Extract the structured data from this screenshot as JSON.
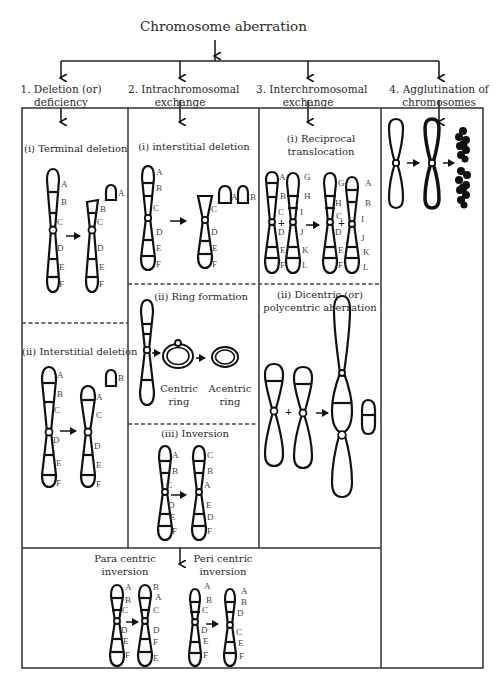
{
  "title": "Chromosome aberration",
  "categories": [
    {
      "id": 1,
      "label_line1": "1. Deletion (or)",
      "label_line2": "deficiency"
    },
    {
      "id": 2,
      "label_line1": "2. Intrachromosomal",
      "label_line2": "exchange"
    },
    {
      "id": 3,
      "label_line1": "3. Interchromosomal",
      "label_line2": "exchange"
    },
    {
      "id": 4,
      "label_line1": "4. Agglutination of",
      "label_line2": "chromosomes"
    }
  ],
  "deletion": {
    "terminal": {
      "title": "(i) Terminal deletion",
      "before_labels": [
        "A",
        "B",
        "C",
        "D",
        "E",
        "F"
      ],
      "after_labels": [
        "B",
        "C",
        "D",
        "E",
        "F"
      ],
      "fragment_label": "A"
    },
    "interstitial": {
      "title": "(ii) Interstitial deletion",
      "before_labels": [
        "A",
        "B",
        "C",
        "D",
        "E",
        "F"
      ],
      "after_labels": [
        "A",
        "C",
        "D",
        "E",
        "F"
      ],
      "fragment_label": "B"
    }
  },
  "intrachromosomal": {
    "interstitial": {
      "title": "(i)  interstitial deletion",
      "before_labels": [
        "A",
        "B",
        "C",
        "D",
        "E",
        "F"
      ],
      "after_labels": [
        "C",
        "D",
        "E",
        "F"
      ],
      "fragment_labels": [
        "A",
        "B"
      ]
    },
    "ring": {
      "title": "(ii) Ring formation",
      "centric_line1": "Centric",
      "centric_line2": "ring",
      "acentric_line1": "Acentric",
      "acentric_line2": "ring"
    },
    "inversion": {
      "title": "(iii) Inversion",
      "before_labels": [
        "A",
        "B",
        "C",
        "D",
        "E",
        "F"
      ],
      "after_labels": [
        "C",
        "B",
        "A",
        "E",
        "D",
        "F"
      ]
    }
  },
  "interchromosomal": {
    "reciprocal": {
      "title_line1": "(i) Reciprocal",
      "title_line2": "translocation",
      "before_left": [
        "A",
        "B",
        "C",
        "D",
        "E",
        "F"
      ],
      "before_right": [
        "G",
        "H",
        "I",
        "J",
        "K",
        "L"
      ],
      "after_left": [
        "G",
        "H",
        "C",
        "D",
        "E",
        "F"
      ],
      "after_right": [
        "A",
        "B",
        "I",
        "J",
        "K",
        "L"
      ]
    },
    "dicentric": {
      "title_line1": "(ii) Dicentric (or)",
      "title_line2": "polycentric aberration"
    }
  },
  "inversion_types": {
    "para": {
      "title_line1": "Para centric",
      "title_line2": "inversion",
      "before_labels": [
        "A",
        "B",
        "C",
        "D",
        "E",
        "F"
      ],
      "after_labels": [
        "B",
        "A",
        "C",
        "D",
        "F",
        "E"
      ]
    },
    "peri": {
      "title_line1": "Peri centric",
      "title_line2": "inversion",
      "before_labels": [
        "A",
        "B",
        "C",
        "D",
        "E",
        "F"
      ],
      "after_labels": [
        "A",
        "B",
        "D",
        "C",
        "E",
        "F"
      ]
    }
  },
  "symbols": {
    "plus": "+",
    "arrow": "→"
  }
}
